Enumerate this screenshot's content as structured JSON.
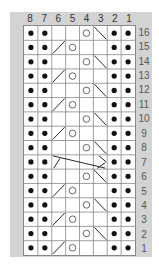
{
  "chart": {
    "columns": [
      "8",
      "7",
      "6",
      "5",
      "4",
      "3",
      "2",
      "1"
    ],
    "rows": [
      {
        "label": "16",
        "cells": [
          "dot",
          "dot",
          "empty",
          "empty",
          "circle",
          "slash-right",
          "dot",
          "dot"
        ]
      },
      {
        "label": "15",
        "cells": [
          "dot",
          "dot",
          "slash-left",
          "circle",
          "empty",
          "empty",
          "dot",
          "dot"
        ]
      },
      {
        "label": "14",
        "cells": [
          "dot",
          "dot",
          "empty",
          "empty",
          "circle",
          "slash-right",
          "dot",
          "dot"
        ]
      },
      {
        "label": "13",
        "cells": [
          "dot",
          "dot",
          "slash-left",
          "circle",
          "empty",
          "empty",
          "dot",
          "dot"
        ]
      },
      {
        "label": "12",
        "cells": [
          "dot",
          "dot",
          "empty",
          "empty",
          "circle",
          "slash-right",
          "dot",
          "dot"
        ]
      },
      {
        "label": "11",
        "cells": [
          "dot",
          "dot",
          "slash-left",
          "circle",
          "empty",
          "empty",
          "dot",
          "dot"
        ]
      },
      {
        "label": "10",
        "cells": [
          "dot",
          "dot",
          "empty",
          "empty",
          "circle",
          "slash-right",
          "dot",
          "dot"
        ]
      },
      {
        "label": "9",
        "cells": [
          "dot",
          "dot",
          "slash-left",
          "circle",
          "empty",
          "empty",
          "dot",
          "dot"
        ]
      },
      {
        "label": "8",
        "cells": [
          "dot",
          "dot",
          "empty",
          "empty",
          "circle",
          "slash-right",
          "dot",
          "dot"
        ]
      },
      {
        "label": "7",
        "cells": [
          "dot",
          "dot",
          "cable",
          "cable",
          "cable",
          "cable",
          "dot",
          "dot"
        ]
      },
      {
        "label": "6",
        "cells": [
          "dot",
          "dot",
          "empty",
          "empty",
          "circle",
          "slash-right",
          "dot",
          "dot"
        ]
      },
      {
        "label": "5",
        "cells": [
          "dot",
          "dot",
          "slash-left",
          "circle",
          "empty",
          "empty",
          "dot",
          "dot"
        ]
      },
      {
        "label": "4",
        "cells": [
          "dot",
          "dot",
          "empty",
          "empty",
          "circle",
          "slash-right",
          "dot",
          "dot"
        ]
      },
      {
        "label": "3",
        "cells": [
          "dot",
          "dot",
          "slash-left",
          "circle",
          "empty",
          "empty",
          "dot",
          "dot"
        ]
      },
      {
        "label": "2",
        "cells": [
          "dot",
          "dot",
          "empty",
          "empty",
          "circle",
          "slash-right",
          "dot",
          "dot"
        ]
      },
      {
        "label": "1",
        "cells": [
          "dot",
          "dot",
          "slash-left",
          "circle",
          "empty",
          "empty",
          "dot",
          "dot"
        ]
      }
    ],
    "legend_symbols": {
      "dot": "purl-stitch-dot",
      "circle": "yarn-over-circle",
      "slash-left": "k2tog-slash",
      "slash-right": "ssk-backslash",
      "cable": "cable-cross",
      "empty": "knit-blank"
    },
    "colors": {
      "panel": "#d3d3d3",
      "grid_line": "#888888",
      "symbol": "#111111",
      "background": "#ffffff"
    }
  }
}
